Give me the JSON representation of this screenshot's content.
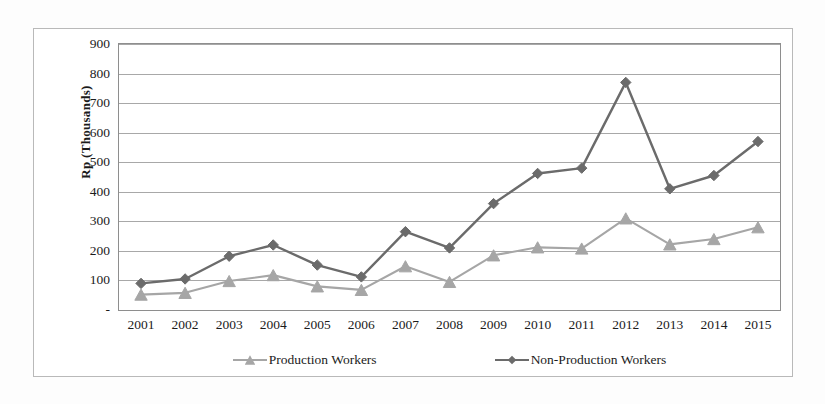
{
  "chart_data": {
    "type": "line",
    "title": "",
    "subtitle": "",
    "xlabel": "",
    "ylabel": "Rp (Thousands)",
    "categories": [
      "2001",
      "2002",
      "2003",
      "2004",
      "2005",
      "2006",
      "2007",
      "2008",
      "2009",
      "2010",
      "2011",
      "2012",
      "2013",
      "2014",
      "2015"
    ],
    "series": [
      {
        "name": "Production Workers",
        "color": "#a6a6a6",
        "marker": "triangle",
        "values": [
          52,
          58,
          98,
          118,
          80,
          68,
          148,
          95,
          185,
          212,
          208,
          310,
          222,
          240,
          280
        ]
      },
      {
        "name": "Non-Production Workers",
        "color": "#6b6b6b",
        "marker": "diamond",
        "values": [
          90,
          105,
          182,
          220,
          152,
          112,
          265,
          210,
          360,
          462,
          480,
          770,
          410,
          455,
          570
        ]
      }
    ],
    "ylim": [
      0,
      900
    ],
    "y_ticks": [
      0,
      100,
      200,
      300,
      400,
      500,
      600,
      700,
      800,
      900
    ],
    "y_tick_labels": [
      "-",
      "100",
      "200",
      "300",
      "400",
      "500",
      "600",
      "700",
      "800",
      "900"
    ],
    "grid": true,
    "grid_axis": "y",
    "legend_position": "bottom",
    "legend": [
      "Production Workers",
      "Non-Production Workers"
    ]
  },
  "colors": {
    "series_light": "#a6a6a6",
    "series_dark": "#6b6b6b",
    "gridline": "#a8a8a8",
    "plot_border": "#8e8e8e",
    "outer_border": "#b9b9b9",
    "text": "#1b1b1b",
    "background": "#ffffff"
  }
}
